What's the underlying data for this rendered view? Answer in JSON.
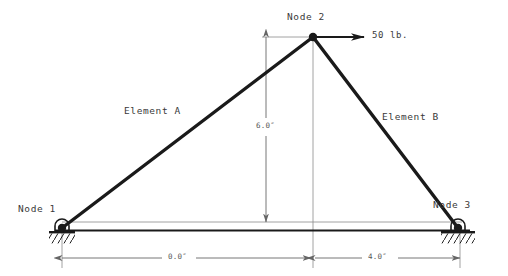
{
  "diagram": {
    "colors": {
      "member": "#1a1a1a",
      "dimension": "#666666",
      "ground": "#1a1a1a",
      "text": "#3a3a3a",
      "background": "#ffffff"
    },
    "nodes": [
      {
        "id": "node-1",
        "label": "Node 1",
        "x": 62,
        "y": 228,
        "support": "pin",
        "label_x": 18,
        "label_y": 204
      },
      {
        "id": "node-2",
        "label": "Node 2",
        "x": 313,
        "y": 37,
        "support": "none",
        "label_x": 288,
        "label_y": 12
      },
      {
        "id": "node-3",
        "label": "Node 3",
        "x": 458,
        "y": 228,
        "support": "pin",
        "label_x": 434,
        "label_y": 200
      }
    ],
    "elements": [
      {
        "id": "element-a",
        "label": "Element A",
        "from": "node-1",
        "to": "node-2",
        "label_x": 124,
        "label_y": 106
      },
      {
        "id": "element-b",
        "label": "Element B",
        "from": "node-2",
        "to": "node-3",
        "label_x": 382,
        "label_y": 112
      }
    ],
    "load": {
      "label": "50 lb.",
      "magnitude": 50,
      "units": "lb.",
      "direction": "horizontal-right",
      "applied_at": "node-2",
      "arrow_from_x": 313,
      "arrow_to_x": 365,
      "arrow_y": 37,
      "label_x": 372,
      "label_y": 30
    },
    "dimensions": [
      {
        "id": "vertical-height",
        "label": "6.0″",
        "value": 6.0,
        "units": "in",
        "orientation": "vertical",
        "x": 266,
        "y_top": 37,
        "y_bottom": 222,
        "label_x": 258,
        "label_y": 126
      },
      {
        "id": "horizontal-left-span",
        "label": "0.0″",
        "value": 0.0,
        "units": "in",
        "orientation": "horizontal",
        "y": 258,
        "x_start": 62,
        "x_end": 313,
        "label_x": 172,
        "label_y": 250
      },
      {
        "id": "horizontal-right-span",
        "label": "4.0″",
        "value": 4.0,
        "units": "in",
        "orientation": "horizontal",
        "y": 258,
        "x_start": 313,
        "x_end": 460,
        "label_x": 372,
        "label_y": 250
      }
    ],
    "baseline": {
      "y": 230,
      "x_start": 55,
      "x_end": 470
    },
    "extension_line": {
      "y": 222,
      "x_start": 62,
      "x_end": 460
    }
  }
}
